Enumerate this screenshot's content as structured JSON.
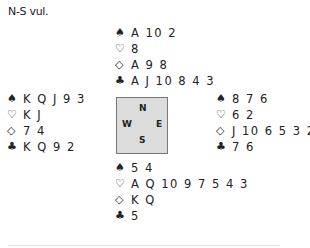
{
  "vulnerability": "N-S vul.",
  "suits": {
    "spades": "♠",
    "hearts": "♡",
    "diamonds": "◇",
    "clubs": "♣"
  },
  "hands": {
    "north": {
      "spades": "A 10 2",
      "hearts": "8",
      "diamonds": "A 9 8",
      "clubs": "A J 10 8 4 3"
    },
    "west": {
      "spades": "K Q J 9 3",
      "hearts": "K J",
      "diamonds": "7 4",
      "clubs": "K Q 9 2"
    },
    "east": {
      "spades": "8 7 6",
      "hearts": "6 2",
      "diamonds": "J 10 6 5 3 2",
      "clubs": "7 6"
    },
    "south": {
      "spades": "5 4",
      "hearts": "A Q 10 9 7 5 4 3",
      "diamonds": "K Q",
      "clubs": "5"
    }
  },
  "compass": {
    "n": "N",
    "w": "W",
    "e": "E",
    "s": "S",
    "background": "#dcdcdc"
  }
}
